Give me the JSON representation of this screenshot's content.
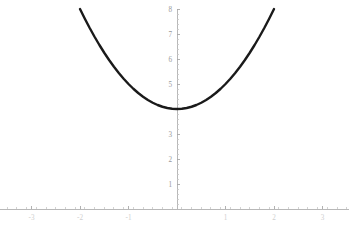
{
  "chart_data": {
    "type": "line",
    "title": "",
    "subtitle": "",
    "xlabel": "",
    "ylabel": "",
    "expression": "y = x^2 + 4",
    "grid": false,
    "legend": null,
    "xlim": [
      -3.5,
      3.5
    ],
    "ylim": [
      0,
      8.3
    ],
    "x_domain_drawn": [
      -2,
      2
    ],
    "x_ticks_major": [
      -3,
      -2,
      -1,
      1,
      2,
      3
    ],
    "x_tick_labels": [
      "-3",
      "-2",
      "-1",
      "1",
      "2",
      "3"
    ],
    "y_ticks_major": [
      1,
      2,
      3,
      4,
      5,
      6,
      7,
      8
    ],
    "y_tick_labels": [
      "1",
      "2",
      "3",
      "4",
      "5",
      "6",
      "7",
      "8"
    ],
    "y_tick_labels_shown": [
      "1",
      "2",
      "3",
      "5",
      "6",
      "7",
      "8"
    ],
    "minor_ticks_per_interval": 4,
    "vertex": {
      "x": 0,
      "y": 4
    },
    "series": [
      {
        "name": "x^2 + 4",
        "color": "#1a1a1a",
        "x": [
          -2,
          -1.9,
          -1.8,
          -1.7,
          -1.6,
          -1.5,
          -1.4,
          -1.3,
          -1.2,
          -1.1,
          -1,
          -0.9,
          -0.8,
          -0.7,
          -0.6,
          -0.5,
          -0.4,
          -0.3,
          -0.2,
          -0.1,
          0,
          0.1,
          0.2,
          0.3,
          0.4,
          0.5,
          0.6,
          0.7,
          0.8,
          0.9,
          1,
          1.1,
          1.2,
          1.3,
          1.4,
          1.5,
          1.6,
          1.7,
          1.8,
          1.9,
          2
        ],
        "values": [
          8,
          7.61,
          7.24,
          6.89,
          6.56,
          6.25,
          5.96,
          5.69,
          5.44,
          5.21,
          5,
          4.81,
          4.64,
          4.49,
          4.36,
          4.25,
          4.16,
          4.09,
          4.04,
          4.01,
          4,
          4.01,
          4.04,
          4.09,
          4.16,
          4.25,
          4.36,
          4.49,
          4.64,
          4.81,
          5,
          5.21,
          5.44,
          5.69,
          5.96,
          6.25,
          6.56,
          6.89,
          7.24,
          7.61,
          8
        ]
      }
    ],
    "axes": {
      "x_axis_value": 0,
      "y_axis_value": 0,
      "axis_color": "#b0b0b0",
      "x_axis_visible": true,
      "y_axis_visible": true
    },
    "background_color": "#ffffff"
  }
}
